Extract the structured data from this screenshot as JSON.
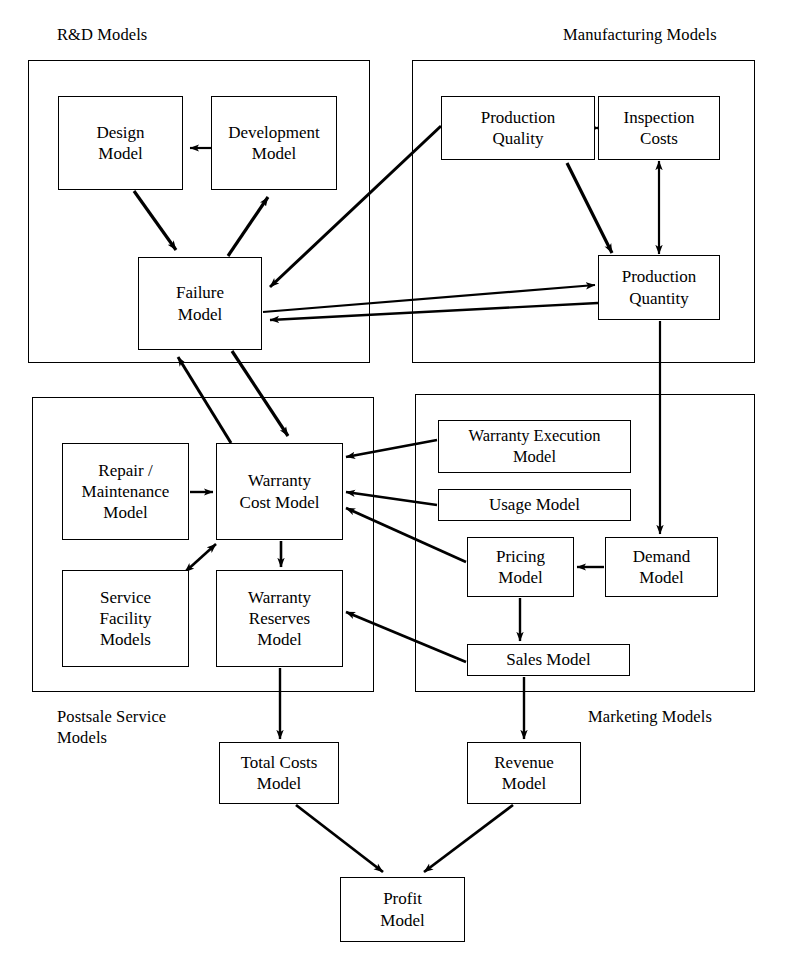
{
  "diagram": {
    "type": "block-flow-diagram",
    "background_color": "#ffffff",
    "line_color": "#000000"
  },
  "regions": [
    {
      "id": "rnd",
      "label": "R&D Models",
      "x": 28,
      "y": 60,
      "w": 342,
      "h": 303,
      "label_x": 57,
      "label_y": 24
    },
    {
      "id": "manufacturing",
      "label": "Manufacturing Models",
      "x": 412,
      "y": 60,
      "w": 343,
      "h": 303,
      "label_x": 563,
      "label_y": 24
    },
    {
      "id": "postsale",
      "label": "Postsale Service\nModels",
      "x": 32,
      "y": 397,
      "w": 342,
      "h": 295,
      "label_x": 57,
      "label_y": 706
    },
    {
      "id": "marketing",
      "label": "Marketing Models",
      "x": 415,
      "y": 394,
      "w": 340,
      "h": 298,
      "label_x": 588,
      "label_y": 706
    }
  ],
  "nodes": [
    {
      "id": "design",
      "label": "Design\nModel",
      "x": 58,
      "y": 96,
      "w": 125,
      "h": 94
    },
    {
      "id": "development",
      "label": "Development\nModel",
      "x": 211,
      "y": 96,
      "w": 126,
      "h": 94
    },
    {
      "id": "failure",
      "label": "Failure\nModel",
      "x": 138,
      "y": 257,
      "w": 124,
      "h": 93
    },
    {
      "id": "prod_quality",
      "label": "Production\nQuality",
      "x": 441,
      "y": 96,
      "w": 154,
      "h": 64
    },
    {
      "id": "inspection",
      "label": "Inspection\nCosts",
      "x": 598,
      "y": 96,
      "w": 122,
      "h": 64
    },
    {
      "id": "prod_quantity",
      "label": "Production\nQuantity",
      "x": 598,
      "y": 255,
      "w": 122,
      "h": 65
    },
    {
      "id": "repair",
      "label": "Repair /\nMaintenance\nModel",
      "x": 62,
      "y": 443,
      "w": 127,
      "h": 97
    },
    {
      "id": "warranty_cost",
      "label": "Warranty\nCost Model",
      "x": 216,
      "y": 443,
      "w": 127,
      "h": 97
    },
    {
      "id": "service_fac",
      "label": "Service\nFacility\nModels",
      "x": 62,
      "y": 570,
      "w": 127,
      "h": 97
    },
    {
      "id": "warranty_res",
      "label": "Warranty\nReserves\nModel",
      "x": 216,
      "y": 570,
      "w": 127,
      "h": 97
    },
    {
      "id": "warranty_exec",
      "label": "Warranty Execution\nModel",
      "x": 438,
      "y": 420,
      "w": 193,
      "h": 53
    },
    {
      "id": "usage",
      "label": "Usage Model",
      "x": 438,
      "y": 489,
      "w": 193,
      "h": 32
    },
    {
      "id": "pricing",
      "label": "Pricing\nModel",
      "x": 467,
      "y": 537,
      "w": 107,
      "h": 60
    },
    {
      "id": "demand",
      "label": "Demand\nModel",
      "x": 605,
      "y": 537,
      "w": 113,
      "h": 60
    },
    {
      "id": "sales",
      "label": "Sales Model",
      "x": 467,
      "y": 644,
      "w": 163,
      "h": 32
    },
    {
      "id": "total_costs",
      "label": "Total Costs\nModel",
      "x": 219,
      "y": 742,
      "w": 120,
      "h": 62
    },
    {
      "id": "revenue",
      "label": "Revenue\nModel",
      "x": 467,
      "y": 742,
      "w": 114,
      "h": 62
    },
    {
      "id": "profit",
      "label": "Profit\nModel",
      "x": 340,
      "y": 877,
      "w": 125,
      "h": 65
    }
  ],
  "edges": [
    {
      "id": "dev-to-design",
      "from": "development",
      "to": "design",
      "arrows": "one"
    },
    {
      "id": "design-to-failure",
      "from": "design",
      "to": "failure",
      "arrows": "one"
    },
    {
      "id": "failure-to-development",
      "from": "failure",
      "to": "development",
      "arrows": "one"
    },
    {
      "id": "quality-to-failure",
      "from": "prod_quality",
      "to": "failure",
      "arrows": "one"
    },
    {
      "id": "quantity-to-failure",
      "from": "prod_quantity",
      "to": "failure",
      "arrows": "one"
    },
    {
      "id": "failure-to-quantity",
      "from": "failure",
      "to": "prod_quantity",
      "arrows": "one"
    },
    {
      "id": "quality-inspection",
      "from": "prod_quality",
      "to": "inspection",
      "arrows": "both"
    },
    {
      "id": "inspection-quantity",
      "from": "inspection",
      "to": "prod_quantity",
      "arrows": "both"
    },
    {
      "id": "quality-to-quantity",
      "from": "prod_quality",
      "to": "prod_quantity",
      "arrows": "one"
    },
    {
      "id": "failure-to-warrantycost",
      "from": "failure",
      "to": "warranty_cost",
      "arrows": "one"
    },
    {
      "id": "warrantycost-to-failure",
      "from": "warranty_cost",
      "to": "failure",
      "arrows": "one"
    },
    {
      "id": "repair-to-warrantycost",
      "from": "repair",
      "to": "warranty_cost",
      "arrows": "one"
    },
    {
      "id": "servicefac-warrantycost",
      "from": "service_fac",
      "to": "warranty_cost",
      "arrows": "both"
    },
    {
      "id": "warrantycost-to-reserves",
      "from": "warranty_cost",
      "to": "warranty_res",
      "arrows": "one"
    },
    {
      "id": "exec-to-warrantycost",
      "from": "warranty_exec",
      "to": "warranty_cost",
      "arrows": "one"
    },
    {
      "id": "usage-to-warrantycost",
      "from": "usage",
      "to": "warranty_cost",
      "arrows": "one"
    },
    {
      "id": "pricing-to-warrantycost",
      "from": "pricing",
      "to": "warranty_cost",
      "arrows": "one"
    },
    {
      "id": "sales-to-reserves",
      "from": "sales",
      "to": "warranty_res",
      "arrows": "one"
    },
    {
      "id": "quantity-to-demand",
      "from": "prod_quantity",
      "to": "demand",
      "arrows": "one"
    },
    {
      "id": "demand-to-pricing",
      "from": "demand",
      "to": "pricing",
      "arrows": "one"
    },
    {
      "id": "pricing-to-sales",
      "from": "pricing",
      "to": "sales",
      "arrows": "one"
    },
    {
      "id": "reserves-to-totalcosts",
      "from": "warranty_res",
      "to": "total_costs",
      "arrows": "one"
    },
    {
      "id": "sales-to-revenue",
      "from": "sales",
      "to": "revenue",
      "arrows": "one"
    },
    {
      "id": "totalcosts-to-profit",
      "from": "total_costs",
      "to": "profit",
      "arrows": "one"
    },
    {
      "id": "revenue-to-profit",
      "from": "revenue",
      "to": "profit",
      "arrows": "one"
    }
  ]
}
